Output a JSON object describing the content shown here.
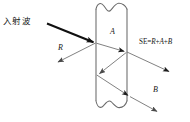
{
  "figure": {
    "background_color": "#ffffff",
    "line_color": "#4a4a4a",
    "ray_color": "#555555",
    "incident_ray_color": "#111111",
    "text_color": "#171717"
  },
  "labels": {
    "incident_wave": "入射波",
    "reflection": "R",
    "absorption": "A",
    "multiple_reflection": "B",
    "formula_prefix": "SE=",
    "formula_r": "R",
    "formula_plus1": "+",
    "formula_a": "A",
    "formula_plus2": "+",
    "formula_b": "B",
    "formula_full": "SE=R+A+B"
  },
  "slab": {
    "name": "shield-slab",
    "left_x": 96,
    "right_x": 127,
    "top_y": 8,
    "bottom_y": 101,
    "break_line_top": true,
    "break_line_bottom": true
  },
  "rays": [
    {
      "name": "incident-ray",
      "label": "入射波",
      "from": [
        48,
        24
      ],
      "to": [
        96,
        43
      ],
      "style": "thick",
      "arrowhead": "solid"
    },
    {
      "name": "reflected-ray",
      "label": "R",
      "from": [
        96,
        43
      ],
      "to": [
        56,
        63
      ],
      "style": "thin",
      "arrowhead": "open"
    },
    {
      "name": "transmitted-ray-1",
      "label": "A",
      "from": [
        96,
        43
      ],
      "to": [
        127,
        52
      ],
      "style": "thin",
      "arrowhead": "solid"
    },
    {
      "name": "exit-ray-se",
      "label": "SE=R+A+B",
      "from": [
        127,
        52
      ],
      "to": [
        172,
        73
      ],
      "style": "thin",
      "arrowhead": "solid"
    },
    {
      "name": "internal-reflection-ray",
      "label": "",
      "from": [
        127,
        52
      ],
      "to": [
        97,
        75
      ],
      "style": "thin",
      "arrowhead": "open"
    },
    {
      "name": "internal-second-ray",
      "label": "B",
      "from": [
        97,
        75
      ],
      "to": [
        131,
        97
      ],
      "style": "thin",
      "arrowhead": "solid"
    },
    {
      "name": "exit-ray-b",
      "label": "B",
      "from": [
        131,
        97
      ],
      "to": [
        160,
        113
      ],
      "style": "thin",
      "arrowhead": "open"
    }
  ],
  "label_positions": {
    "incident_wave": {
      "x": 3,
      "y": 17
    },
    "reflection": {
      "x": 58,
      "y": 44
    },
    "absorption": {
      "x": 110,
      "y": 29
    },
    "multiple_reflection": {
      "x": 153,
      "y": 86
    },
    "formula": {
      "x": 139,
      "y": 40
    }
  }
}
